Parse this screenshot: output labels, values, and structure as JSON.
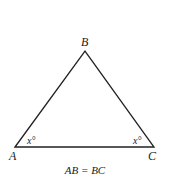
{
  "diagram": {
    "type": "triangle",
    "vertices": {
      "A": {
        "label": "A"
      },
      "B": {
        "label": "B"
      },
      "C": {
        "label": "C"
      }
    },
    "angle_labels": {
      "A": "x°",
      "C": "x°"
    },
    "caption": "AB = BC",
    "stroke_color": "#222222"
  }
}
